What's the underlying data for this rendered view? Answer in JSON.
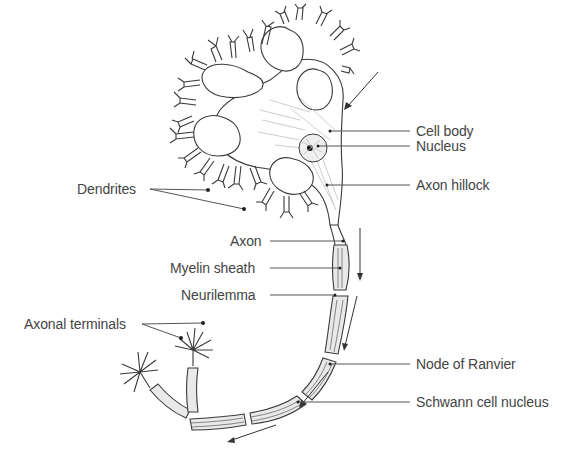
{
  "diagram": {
    "labels": {
      "cell_body": "Cell body",
      "nucleus": "Nucleus",
      "axon_hillock": "Axon hillock",
      "dendrites": "Dendrites",
      "axon": "Axon",
      "myelin_sheath": "Myelin sheath",
      "neurilemma": "Neurilemma",
      "axonal_terminals": "Axonal terminals",
      "node_of_ranvier": "Node of Ranvier",
      "schwann_cell_nucleus": "Schwann cell nucleus"
    },
    "colors": {
      "line": "#3a3a3a",
      "label_text": "#444444",
      "sheath_fill": "#e9e9e9",
      "background": "#ffffff"
    },
    "arrows": [
      {
        "name": "signal-direction-incoming",
        "description": "points toward cell body from upper right"
      },
      {
        "name": "signal-direction-axon-1",
        "description": "down along axon"
      },
      {
        "name": "signal-direction-axon-2",
        "description": "down along axon"
      },
      {
        "name": "signal-direction-axon-3",
        "description": "down along curve"
      },
      {
        "name": "signal-direction-terminal",
        "description": "toward axonal terminals, lower left"
      }
    ]
  }
}
